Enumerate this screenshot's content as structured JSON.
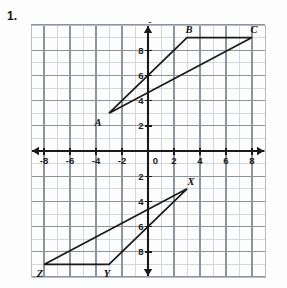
{
  "problem": {
    "number": "1."
  },
  "axes": {
    "x_label": "x",
    "y_label": "y",
    "origin_label": "0",
    "x_tick_labels": [
      "-8",
      "-6",
      "-4",
      "-2",
      "2",
      "4",
      "6",
      "8"
    ],
    "y_tick_labels_positive": [
      "2",
      "4",
      "6",
      "8"
    ],
    "y_tick_labels_negative": [
      "2",
      "4",
      "6",
      "8"
    ]
  },
  "chart_data": {
    "type": "scatter",
    "title": "",
    "xlabel": "x",
    "ylabel": "y",
    "xlim": [
      -9.5,
      9.5
    ],
    "ylim": [
      -10.5,
      10.5
    ],
    "grid": true,
    "minor_grid_step": 1,
    "major_grid_step": 2,
    "x_ticks": [
      -8,
      -6,
      -4,
      -2,
      0,
      2,
      4,
      6,
      8
    ],
    "y_ticks": [
      -8,
      -6,
      -4,
      -2,
      2,
      4,
      6,
      8
    ],
    "legend": "none",
    "annotations": [
      "1."
    ],
    "series": [
      {
        "name": "Triangle ABC",
        "type": "closed-polygon",
        "points": [
          {
            "label": "A",
            "x": -3,
            "y": 3,
            "label_dx": -11,
            "label_dy": 13
          },
          {
            "label": "B",
            "x": 3,
            "y": 9,
            "label_dx": 2,
            "label_dy": -5
          },
          {
            "label": "C",
            "x": 8,
            "y": 9,
            "label_dx": 2,
            "label_dy": -5
          }
        ]
      },
      {
        "name": "Triangle XYZ",
        "type": "closed-polygon",
        "points": [
          {
            "label": "X",
            "x": 3,
            "y": -3,
            "label_dx": 4,
            "label_dy": -4
          },
          {
            "label": "Y",
            "x": -3,
            "y": -9,
            "label_dx": -2,
            "label_dy": 13
          },
          {
            "label": "Z",
            "x": -8,
            "y": -9,
            "label_dx": -4,
            "label_dy": 13
          }
        ]
      }
    ]
  },
  "colors": {
    "grid_minor": "#c9cdd4",
    "grid_major": "#8e949d",
    "axis": "#1a1a1a",
    "shape_stroke": "#1a1a1a",
    "frame": "#b8bcc4",
    "text": "#111111",
    "background": "#fdfdfd"
  }
}
